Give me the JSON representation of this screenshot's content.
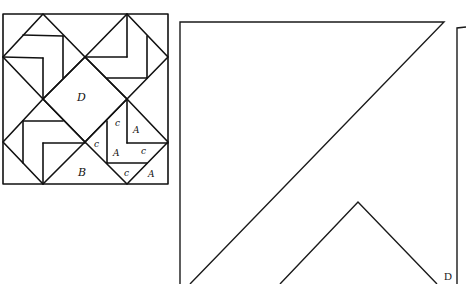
{
  "block": {
    "labels": {
      "center": "D",
      "corner": "B",
      "c1": "c",
      "a1": "A",
      "c2": "c",
      "a2": "A",
      "c3": "c",
      "c4": "c",
      "a3": "A"
    }
  },
  "template": {
    "label": "D"
  },
  "colors": {
    "line": "#111111",
    "background": "#ffffff"
  }
}
